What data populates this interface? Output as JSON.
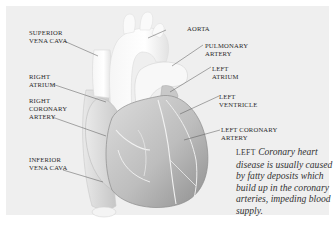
{
  "diagram": {
    "labels": {
      "superior_vena_cava": "SUPERIOR\nVENA CAVA",
      "right_atrium": "RIGHT\nATRIUM",
      "right_coronary_artery": "RIGHT\nCORONARY\nARTERY",
      "inferior_vena_cava": "INFERIOR\nVENA CAVA",
      "aorta": "AORTA",
      "pulmonary_artery": "PULMONARY\nARTERY",
      "left_atrium": "LEFT\nATRIUM",
      "left_ventricle": "LEFT\nVENTRICLE",
      "left_coronary_artery": "LEFT CORONARY\nARTERY"
    },
    "caption": {
      "lead": "LEFT",
      "text": "Coronary heart disease is usually caused by fatty deposits which build up in the coronary arteries, impeding blood supply."
    }
  },
  "colors": {
    "background": "#efefef",
    "page": "#ffffff",
    "text": "#2a2a2a",
    "leader_line": "#555555"
  }
}
